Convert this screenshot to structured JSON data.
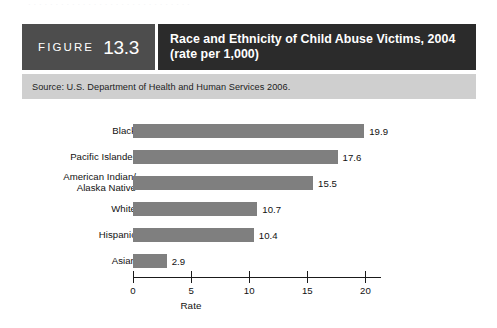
{
  "page": {
    "top_cutoff_text": "· · · · · · · · · · · · · · · · · · · · · · · · · · · · · ·"
  },
  "figure": {
    "label_word": "FIGURE",
    "number": "13.3",
    "title": "Race and Ethnicity of Child Abuse Victims, 2004 (rate per 1,000)",
    "source": "Source: U.S. Department of Health and Human Services 2006.",
    "colors": {
      "figure_block": "#4d4d4d",
      "title_block": "#2b2b2b",
      "source_band": "#cfcfcf",
      "bar_fill": "#7f7f7f",
      "axis": "#1a1a1a"
    }
  },
  "chart_data": {
    "type": "bar",
    "orientation": "horizontal",
    "title": "Race and Ethnicity of Child Abuse Victims, 2004 (rate per 1,000)",
    "categories": [
      "Black",
      "Pacific Islander",
      "American Indian/\nAlaska Native",
      "White",
      "Hispanic",
      "Asian"
    ],
    "values": [
      19.9,
      17.6,
      15.5,
      10.7,
      10.4,
      2.9
    ],
    "value_labels": [
      "19.9",
      "17.6",
      "15.5",
      "10.7",
      "10.4",
      "2.9"
    ],
    "xlabel": "Rate",
    "ylabel": "",
    "xlim": [
      0,
      20
    ],
    "xticks": [
      0,
      5,
      10,
      15,
      20
    ],
    "xtick_labels": [
      "0",
      "5",
      "10",
      "15",
      "20"
    ],
    "grid": false,
    "legend": false
  }
}
